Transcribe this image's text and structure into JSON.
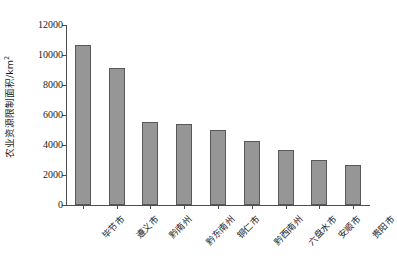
{
  "chart_data": {
    "type": "bar",
    "title": "",
    "xlabel": "",
    "ylabel": "农业资源限制面积/km²",
    "ylabel_text": "农业资源限制面积/km",
    "ylabel_sup": "2",
    "categories": [
      "毕节市",
      "遵义市",
      "黔南州",
      "黔东南州",
      "铜仁市",
      "黔西南州",
      "六盘水市",
      "安顺市",
      "贵阳市"
    ],
    "values": [
      10700,
      9150,
      5550,
      5400,
      5000,
      4250,
      3650,
      3000,
      2700
    ],
    "ylim": [
      0,
      12000
    ],
    "ytick_labels": [
      "0",
      "2000",
      "4000",
      "6000",
      "8000",
      "10000",
      "12000"
    ],
    "ytick_values": [
      0,
      2000,
      4000,
      6000,
      8000,
      10000,
      12000
    ],
    "grid": false,
    "legend": null,
    "bar_color": "#969696",
    "bar_edge_color": "#595959",
    "axis_color": "#4d4d4d",
    "background": "#ffffff"
  }
}
